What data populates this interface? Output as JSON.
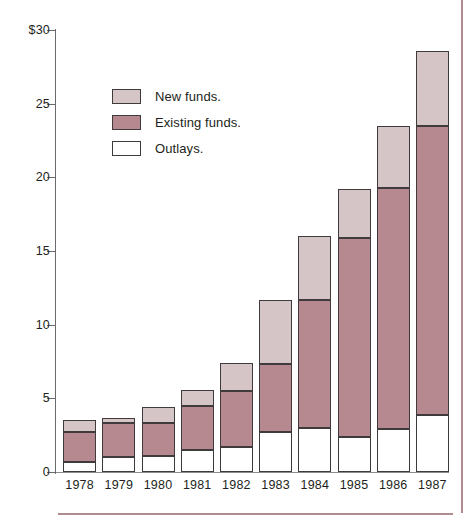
{
  "chart_data": {
    "type": "bar",
    "subtype": "stacked-vertical",
    "title": "",
    "xlabel": "",
    "ylabel": "",
    "ylim": [
      0,
      30
    ],
    "yticks": [
      0,
      5,
      10,
      15,
      20,
      25,
      30
    ],
    "ytick_labels": [
      "0",
      "5",
      "10",
      "15",
      "20",
      "25",
      "$30"
    ],
    "grid": false,
    "legend_position": "upper-left-inside",
    "categories": [
      "1978",
      "1979",
      "1980",
      "1981",
      "1982",
      "1983",
      "1984",
      "1985",
      "1986",
      "1987"
    ],
    "series": [
      {
        "name": "Outlays.",
        "color": "#ffffff",
        "values": [
          0.7,
          1.0,
          1.1,
          1.5,
          1.7,
          2.7,
          3.0,
          2.4,
          2.9,
          3.9
        ]
      },
      {
        "name": "Existing funds.",
        "color": "#b5898f",
        "values": [
          2.0,
          2.3,
          2.2,
          3.0,
          3.8,
          4.6,
          8.7,
          13.5,
          16.4,
          19.6
        ]
      },
      {
        "name": "New funds.",
        "color": "#d5c5c6",
        "values": [
          0.8,
          0.4,
          1.1,
          1.1,
          1.9,
          4.4,
          4.3,
          3.3,
          4.2,
          5.1
        ]
      }
    ],
    "totals": [
      3.5,
      3.7,
      4.4,
      5.6,
      7.4,
      11.7,
      16.0,
      19.2,
      23.5,
      28.6
    ],
    "segment_boundaries_note": "Each bar stacks Outlays (bottom, white), Existing funds (middle, rose), New funds (top, light mauve).",
    "cumulative": {
      "outlays_top": [
        0.7,
        1.0,
        1.1,
        1.5,
        1.7,
        2.7,
        3.0,
        2.4,
        2.9,
        3.9
      ],
      "existing_top": [
        2.7,
        3.3,
        3.3,
        4.5,
        5.5,
        7.3,
        11.7,
        15.9,
        19.3,
        23.5
      ],
      "new_top": [
        3.5,
        3.7,
        4.4,
        5.6,
        7.4,
        11.7,
        16.0,
        19.2,
        23.5,
        28.6
      ]
    }
  },
  "legend": {
    "items": [
      {
        "label": "New funds.",
        "color": "#d5c5c6",
        "swatch": "sw-new"
      },
      {
        "label": "Existing funds.",
        "color": "#b5898f",
        "swatch": "sw-existing"
      },
      {
        "label": "Outlays.",
        "color": "#ffffff",
        "swatch": "sw-outlays"
      }
    ]
  },
  "colors": {
    "new_funds": "#d5c5c6",
    "existing_funds": "#b5898f",
    "outlays": "#ffffff",
    "bar_outline": "#3f3a3b",
    "axis": "#6d6a6b",
    "text": "#231f20",
    "rule": "#b08c90",
    "background": "#ffffff"
  }
}
